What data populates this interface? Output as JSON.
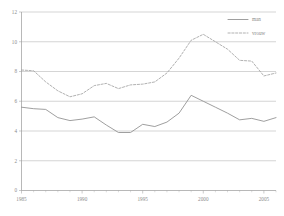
{
  "chart_data": {
    "type": "line",
    "title": "",
    "subtitle": "",
    "xlabel": "",
    "ylabel": "",
    "xlim": [
      1985,
      2006
    ],
    "ylim": [
      0,
      12
    ],
    "grid": true,
    "legend_position": "top-right",
    "y_ticks": [
      "0",
      "2",
      "4",
      "6",
      "8",
      "10",
      "12"
    ],
    "y_tick_values": [
      0,
      2,
      4,
      6,
      8,
      10,
      12
    ],
    "x_ticks": [
      "1985",
      "1990",
      "1995",
      "2000",
      "2005"
    ],
    "x_tick_values": [
      1985,
      1990,
      1995,
      2000,
      2005
    ],
    "x": [
      1985,
      1986,
      1987,
      1988,
      1989,
      1990,
      1991,
      1992,
      1993,
      1994,
      1995,
      1996,
      1997,
      1998,
      1999,
      2000,
      2001,
      2002,
      2003,
      2004,
      2005,
      2006
    ],
    "series": [
      {
        "name": "man",
        "style": "solid",
        "color": "#8e8e8e",
        "values": [
          5.6,
          5.5,
          5.45,
          4.9,
          4.7,
          4.8,
          4.95,
          4.4,
          3.9,
          3.9,
          4.45,
          4.3,
          4.6,
          5.2,
          6.4,
          6.0,
          5.6,
          5.2,
          4.75,
          4.85,
          4.65,
          4.9
        ]
      },
      {
        "name": "vrouw",
        "style": "dashed",
        "color": "#a3a3a3",
        "values": [
          8.1,
          8.05,
          7.3,
          6.7,
          6.3,
          6.5,
          7.05,
          7.2,
          6.85,
          7.1,
          7.15,
          7.3,
          7.9,
          8.9,
          10.1,
          10.5,
          10.0,
          9.5,
          8.75,
          8.7,
          7.7,
          7.9
        ]
      }
    ],
    "legend": [
      {
        "label": "man",
        "style": "solid",
        "color": "#8e8e8e"
      },
      {
        "label": "vrouw",
        "style": "dashed",
        "color": "#a3a3a3"
      }
    ]
  },
  "colors": {
    "background": "#ffffff",
    "axis": "#9a9a9a",
    "grid": "#b9b9b9",
    "text": "#8a8a8a",
    "series_man": "#8e8e8e",
    "series_vrouw": "#a3a3a3"
  }
}
